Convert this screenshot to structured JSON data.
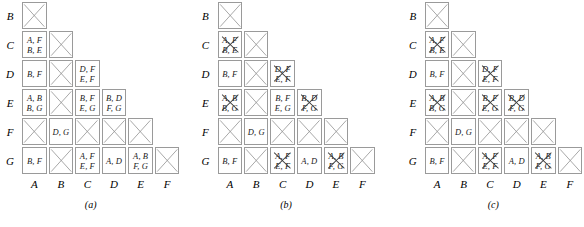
{
  "figure": {
    "row_labels": [
      "B",
      "C",
      "D",
      "E",
      "F",
      "G"
    ],
    "col_labels": [
      "A",
      "B",
      "C",
      "D",
      "E",
      "F"
    ],
    "line_color": "#9a9a9a",
    "strike_color": "#3a3a3a",
    "text_color": "#1a1a1a"
  },
  "panels": [
    {
      "caption": "(a)",
      "rows": [
        {
          "label": "B",
          "cells": [
            {
              "kind": "x",
              "text": ""
            },
            {
              "kind": "none",
              "text": ""
            },
            {
              "kind": "none",
              "text": ""
            },
            {
              "kind": "none",
              "text": ""
            },
            {
              "kind": "none",
              "text": ""
            },
            {
              "kind": "none",
              "text": ""
            }
          ]
        },
        {
          "label": "C",
          "cells": [
            {
              "kind": "text",
              "text": "A, F\nB, E"
            },
            {
              "kind": "x",
              "text": ""
            },
            {
              "kind": "none",
              "text": ""
            },
            {
              "kind": "none",
              "text": ""
            },
            {
              "kind": "none",
              "text": ""
            },
            {
              "kind": "none",
              "text": ""
            }
          ]
        },
        {
          "label": "D",
          "cells": [
            {
              "kind": "text",
              "text": "B, F"
            },
            {
              "kind": "x",
              "text": ""
            },
            {
              "kind": "text",
              "text": "D, F\nE, F"
            },
            {
              "kind": "none",
              "text": ""
            },
            {
              "kind": "none",
              "text": ""
            },
            {
              "kind": "none",
              "text": ""
            }
          ]
        },
        {
          "label": "E",
          "cells": [
            {
              "kind": "text",
              "text": "A, B\nB, G"
            },
            {
              "kind": "x",
              "text": ""
            },
            {
              "kind": "text",
              "text": "B, F\nE, G"
            },
            {
              "kind": "text",
              "text": "B, D\nF, G"
            },
            {
              "kind": "none",
              "text": ""
            },
            {
              "kind": "none",
              "text": ""
            }
          ]
        },
        {
          "label": "F",
          "cells": [
            {
              "kind": "x",
              "text": ""
            },
            {
              "kind": "text",
              "text": "D, G"
            },
            {
              "kind": "x",
              "text": ""
            },
            {
              "kind": "x",
              "text": ""
            },
            {
              "kind": "x",
              "text": ""
            },
            {
              "kind": "none",
              "text": ""
            }
          ]
        },
        {
          "label": "G",
          "cells": [
            {
              "kind": "text",
              "text": "B, F"
            },
            {
              "kind": "x",
              "text": ""
            },
            {
              "kind": "text",
              "text": "A, F\nE, F"
            },
            {
              "kind": "text",
              "text": "A, D"
            },
            {
              "kind": "text",
              "text": "A, B\nF, G"
            },
            {
              "kind": "x",
              "text": ""
            }
          ]
        }
      ]
    },
    {
      "caption": "(b)",
      "rows": [
        {
          "label": "B",
          "cells": [
            {
              "kind": "x",
              "text": ""
            },
            {
              "kind": "none",
              "text": ""
            },
            {
              "kind": "none",
              "text": ""
            },
            {
              "kind": "none",
              "text": ""
            },
            {
              "kind": "none",
              "text": ""
            },
            {
              "kind": "none",
              "text": ""
            }
          ]
        },
        {
          "label": "C",
          "cells": [
            {
              "kind": "struck",
              "text": "A, F\nB, E"
            },
            {
              "kind": "x",
              "text": ""
            },
            {
              "kind": "none",
              "text": ""
            },
            {
              "kind": "none",
              "text": ""
            },
            {
              "kind": "none",
              "text": ""
            },
            {
              "kind": "none",
              "text": ""
            }
          ]
        },
        {
          "label": "D",
          "cells": [
            {
              "kind": "text",
              "text": "B, F"
            },
            {
              "kind": "x",
              "text": ""
            },
            {
              "kind": "struck",
              "text": "D, F\nE, F"
            },
            {
              "kind": "none",
              "text": ""
            },
            {
              "kind": "none",
              "text": ""
            },
            {
              "kind": "none",
              "text": ""
            }
          ]
        },
        {
          "label": "E",
          "cells": [
            {
              "kind": "struck",
              "text": "A, B\nB, G"
            },
            {
              "kind": "x",
              "text": ""
            },
            {
              "kind": "text",
              "text": "B, F\nE, G"
            },
            {
              "kind": "struck",
              "text": "B, D\nF, G"
            },
            {
              "kind": "none",
              "text": ""
            },
            {
              "kind": "none",
              "text": ""
            }
          ]
        },
        {
          "label": "F",
          "cells": [
            {
              "kind": "x",
              "text": ""
            },
            {
              "kind": "text",
              "text": "D, G"
            },
            {
              "kind": "x",
              "text": ""
            },
            {
              "kind": "x",
              "text": ""
            },
            {
              "kind": "x",
              "text": ""
            },
            {
              "kind": "none",
              "text": ""
            }
          ]
        },
        {
          "label": "G",
          "cells": [
            {
              "kind": "text",
              "text": "B, F"
            },
            {
              "kind": "x",
              "text": ""
            },
            {
              "kind": "struck",
              "text": "A, F\nE, F"
            },
            {
              "kind": "text",
              "text": "A, D"
            },
            {
              "kind": "struck",
              "text": "A, B\nF, G"
            },
            {
              "kind": "x",
              "text": ""
            }
          ]
        }
      ]
    },
    {
      "caption": "(c)",
      "rows": [
        {
          "label": "B",
          "cells": [
            {
              "kind": "x",
              "text": ""
            },
            {
              "kind": "none",
              "text": ""
            },
            {
              "kind": "none",
              "text": ""
            },
            {
              "kind": "none",
              "text": ""
            },
            {
              "kind": "none",
              "text": ""
            },
            {
              "kind": "none",
              "text": ""
            }
          ]
        },
        {
          "label": "C",
          "cells": [
            {
              "kind": "struck",
              "text": "A, F\nB, E"
            },
            {
              "kind": "x",
              "text": ""
            },
            {
              "kind": "none",
              "text": ""
            },
            {
              "kind": "none",
              "text": ""
            },
            {
              "kind": "none",
              "text": ""
            },
            {
              "kind": "none",
              "text": ""
            }
          ]
        },
        {
          "label": "D",
          "cells": [
            {
              "kind": "text",
              "text": "B, F"
            },
            {
              "kind": "x",
              "text": ""
            },
            {
              "kind": "struck",
              "text": "D, F\nE, F"
            },
            {
              "kind": "none",
              "text": ""
            },
            {
              "kind": "none",
              "text": ""
            },
            {
              "kind": "none",
              "text": ""
            }
          ]
        },
        {
          "label": "E",
          "cells": [
            {
              "kind": "struck",
              "text": "A, B\nB, G"
            },
            {
              "kind": "x",
              "text": ""
            },
            {
              "kind": "struck",
              "text": "B, F\nE, G"
            },
            {
              "kind": "struck",
              "text": "B, D\nF, G"
            },
            {
              "kind": "none",
              "text": ""
            },
            {
              "kind": "none",
              "text": ""
            }
          ]
        },
        {
          "label": "F",
          "cells": [
            {
              "kind": "x",
              "text": ""
            },
            {
              "kind": "text",
              "text": "D, G"
            },
            {
              "kind": "x",
              "text": ""
            },
            {
              "kind": "x",
              "text": ""
            },
            {
              "kind": "x",
              "text": ""
            },
            {
              "kind": "none",
              "text": ""
            }
          ]
        },
        {
          "label": "G",
          "cells": [
            {
              "kind": "text",
              "text": "B, F"
            },
            {
              "kind": "x",
              "text": ""
            },
            {
              "kind": "struck",
              "text": "A, F\nE, F"
            },
            {
              "kind": "text",
              "text": "A, D"
            },
            {
              "kind": "struck",
              "text": "A, B\nF, G"
            },
            {
              "kind": "x",
              "text": ""
            }
          ]
        }
      ]
    }
  ]
}
